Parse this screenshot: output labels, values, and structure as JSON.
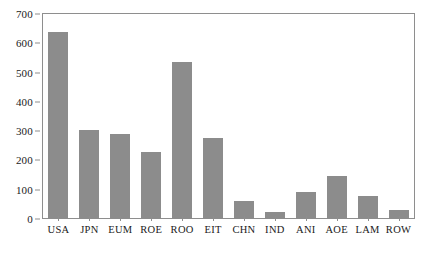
{
  "chart_data": {
    "type": "bar",
    "title": "",
    "subtitle": "",
    "xlabel": "",
    "ylabel": "",
    "categories": [
      "USA",
      "JPN",
      "EUM",
      "ROE",
      "ROO",
      "EIT",
      "CHN",
      "IND",
      "ANI",
      "AOE",
      "LAM",
      "ROW"
    ],
    "values": [
      640,
      305,
      290,
      230,
      535,
      275,
      62,
      25,
      92,
      148,
      80,
      32
    ],
    "series": [
      {
        "name": "value",
        "values": [
          640,
          305,
          290,
          230,
          535,
          275,
          62,
          25,
          92,
          148,
          80,
          32
        ]
      }
    ],
    "ylim": [
      0,
      700
    ],
    "yticks": [
      0,
      100,
      200,
      300,
      400,
      500,
      600,
      700
    ],
    "ytick_labels": [
      "0",
      "100",
      "200",
      "300",
      "400",
      "500",
      "600",
      "700"
    ],
    "grid": false,
    "legend": false,
    "legend_position": "none",
    "bar_color": "#8c8c8c",
    "frame_color": "#8e8e8e",
    "background_color": "#ffffff"
  }
}
